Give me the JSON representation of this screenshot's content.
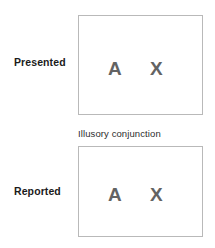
{
  "figure": {
    "title": "",
    "colors": {
      "background": "#ffffff",
      "box_border": "#b9b9b9",
      "box_fill": "#ffffff",
      "letter": "#636363",
      "label_text": "#1b1b1b",
      "caption_text": "#2d2d2d"
    }
  },
  "rows": {
    "presented": {
      "label": "Presented",
      "letters": [
        {
          "char": "A",
          "color": "#636363"
        },
        {
          "char": "X",
          "color": "#636363"
        }
      ]
    },
    "reported": {
      "label": "Reported",
      "caption": "Illusory conjunction",
      "letters": [
        {
          "char": "A",
          "color": "#636363"
        },
        {
          "char": "X",
          "color": "#636363"
        }
      ]
    }
  }
}
